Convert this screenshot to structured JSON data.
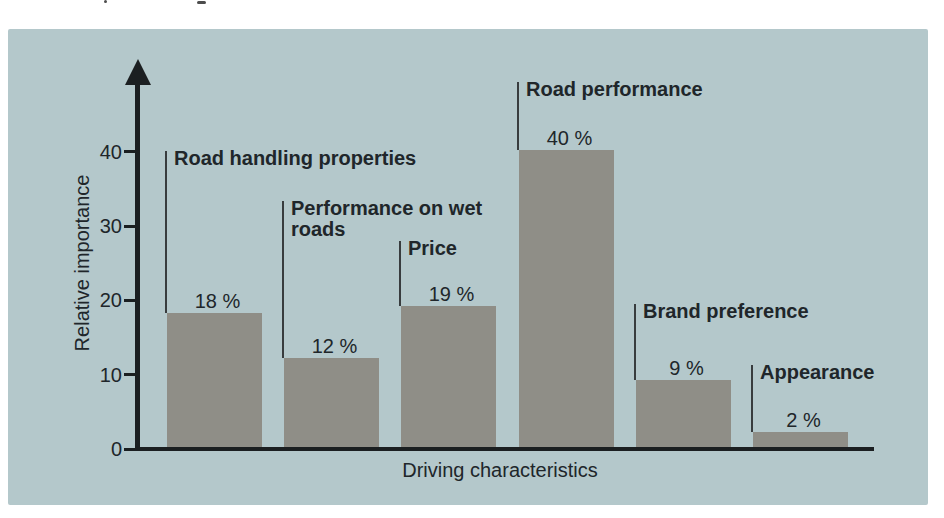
{
  "page": {
    "background_color": "#ffffff"
  },
  "panel": {
    "background_color": "#b4c8cb"
  },
  "chart_data": {
    "type": "bar",
    "title": "",
    "xlabel": "Driving characteristics",
    "ylabel": "Relative importance",
    "categories": [
      "Road handling properties",
      "Performance on wet\nroads",
      "Price",
      "Road performance",
      "Brand preference",
      "Appearance"
    ],
    "values": [
      18,
      12,
      19,
      40,
      9,
      2
    ],
    "value_labels": [
      "18 %",
      "12 %",
      "19 %",
      "40 %",
      "9 %",
      "2 %"
    ],
    "yticks": [
      0,
      10,
      20,
      30,
      40
    ],
    "ylim": [
      0,
      47
    ],
    "grid": false,
    "legend": false,
    "bar_color": "#8f8e87",
    "axis_color": "#1b1f21",
    "leader_line_color": "#383c3e",
    "text_color": "#20262a",
    "panel_color": "#b4c8cb",
    "layout_hints": {
      "orientation": "vertical",
      "category_labels_above_bars_with_leader_lines": true,
      "label_tops_px": [
        151,
        201,
        241,
        82,
        304,
        365
      ]
    }
  }
}
